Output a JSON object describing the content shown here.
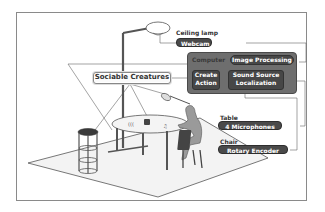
{
  "diagram": {
    "labels": {
      "ceiling_lamp": "Ceiling lamp",
      "webcam": "Webcam",
      "computer": "Computer",
      "image_processing": "Image Processing",
      "create_action_line1": "Create",
      "create_action_line2": "Action",
      "sound_source_line1": "Sound Source",
      "sound_source_line2": "Localization",
      "sociable_creatures": "Sociable Creatures",
      "table": "Table",
      "microphones": "4 Microphones",
      "chair": "Chair",
      "rotary_encoder": "Rotary Encoder"
    },
    "colors": {
      "pill_fill": "#4a4a4a",
      "computer_fill": "#6e6e6e",
      "line": "#555555",
      "floor": "#f2f2f2"
    }
  }
}
